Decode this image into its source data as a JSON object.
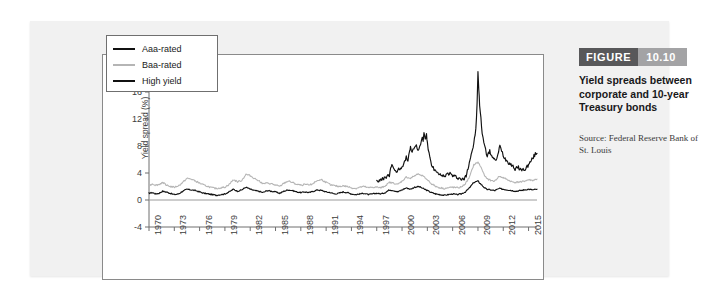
{
  "figure": {
    "label": "FIGURE",
    "number": "10.10",
    "caption": "Yield spreads between corporate and 10-year Treasury bonds",
    "source": "Source: Federal Reserve Bank of St. Louis",
    "label_bg": "#58585a",
    "number_bg": "#a3a3a5"
  },
  "chart_data": {
    "type": "line",
    "title": "Yield spreads between corporate and 10-year Treasury bonds",
    "xlabel": "",
    "ylabel": "Yield spread (%)",
    "xlim": [
      1970,
      2016
    ],
    "ylim": [
      -4,
      20
    ],
    "grid": false,
    "legend_position": "top-left",
    "ytick_labels": [
      "20",
      "16",
      "12",
      "8",
      "4",
      "0",
      "-4"
    ],
    "ytick_values": [
      20,
      16,
      12,
      8,
      4,
      0,
      -4
    ],
    "xtick_labels": [
      "1970",
      "1973",
      "1976",
      "1979",
      "1982",
      "1985",
      "1988",
      "1991",
      "1994",
      "1997",
      "2000",
      "2003",
      "2006",
      "2009",
      "2012",
      "2015"
    ],
    "xtick_values": [
      1970,
      1973,
      1976,
      1979,
      1982,
      1985,
      1988,
      1991,
      1994,
      1997,
      2000,
      2003,
      2006,
      2009,
      2012,
      2015
    ],
    "series": [
      {
        "name": "Aaa-rated",
        "color": "#111111",
        "x": [
          1970.0,
          1970.4,
          1970.8,
          1971.2,
          1971.6,
          1972.0,
          1972.5,
          1973.0,
          1973.5,
          1974.0,
          1974.5,
          1975.0,
          1975.5,
          1976.0,
          1976.5,
          1977.0,
          1977.5,
          1978.0,
          1978.5,
          1979.0,
          1979.5,
          1980.0,
          1980.5,
          1981.0,
          1981.5,
          1982.0,
          1982.5,
          1983.0,
          1983.5,
          1984.0,
          1984.5,
          1985.0,
          1985.5,
          1986.0,
          1986.5,
          1987.0,
          1987.5,
          1988.0,
          1988.5,
          1989.0,
          1989.5,
          1990.0,
          1990.5,
          1991.0,
          1991.5,
          1992.0,
          1992.5,
          1993.0,
          1993.5,
          1994.0,
          1994.5,
          1995.0,
          1995.5,
          1996.0,
          1996.5,
          1997.0,
          1997.5,
          1998.0,
          1998.5,
          1999.0,
          1999.5,
          2000.0,
          2000.5,
          2001.0,
          2001.5,
          2002.0,
          2002.5,
          2003.0,
          2003.5,
          2004.0,
          2004.5,
          2005.0,
          2005.5,
          2006.0,
          2006.5,
          2007.0,
          2007.5,
          2008.0,
          2008.5,
          2009.0,
          2009.3,
          2009.7,
          2010.0,
          2010.5,
          2011.0,
          2011.5,
          2012.0,
          2012.5,
          2013.0,
          2013.5,
          2014.0,
          2014.5,
          2015.0,
          2015.5,
          2016.0
        ],
        "y": [
          1.0,
          1.1,
          0.9,
          1.0,
          1.3,
          1.2,
          1.0,
          0.8,
          0.9,
          1.3,
          1.6,
          1.5,
          1.4,
          1.2,
          1.0,
          0.9,
          0.8,
          0.7,
          0.8,
          0.9,
          1.2,
          1.6,
          1.3,
          1.5,
          1.9,
          1.6,
          1.4,
          1.3,
          1.1,
          1.4,
          1.3,
          1.2,
          1.0,
          1.3,
          1.5,
          1.4,
          1.2,
          1.1,
          1.2,
          1.1,
          1.3,
          1.5,
          1.4,
          1.2,
          1.1,
          0.9,
          1.0,
          1.2,
          1.1,
          0.9,
          0.8,
          0.9,
          1.0,
          0.8,
          0.9,
          1.0,
          0.9,
          1.1,
          1.5,
          1.4,
          1.2,
          1.5,
          1.8,
          1.6,
          1.9,
          2.0,
          1.7,
          1.4,
          1.1,
          0.9,
          0.8,
          0.7,
          0.8,
          0.9,
          0.8,
          0.9,
          1.2,
          1.8,
          2.6,
          2.8,
          2.4,
          1.9,
          1.6,
          1.5,
          1.4,
          1.7,
          1.6,
          1.5,
          1.4,
          1.3,
          1.4,
          1.5,
          1.6,
          1.5,
          1.6
        ]
      },
      {
        "name": "Baa-rated",
        "color": "#b5b5b5",
        "x": [
          1970.0,
          1970.4,
          1970.8,
          1971.2,
          1971.6,
          1972.0,
          1972.5,
          1973.0,
          1973.5,
          1974.0,
          1974.5,
          1975.0,
          1975.5,
          1976.0,
          1976.5,
          1977.0,
          1977.5,
          1978.0,
          1978.5,
          1979.0,
          1979.5,
          1980.0,
          1980.5,
          1981.0,
          1981.5,
          1982.0,
          1982.5,
          1983.0,
          1983.5,
          1984.0,
          1984.5,
          1985.0,
          1985.5,
          1986.0,
          1986.5,
          1987.0,
          1987.5,
          1988.0,
          1988.5,
          1989.0,
          1989.5,
          1990.0,
          1990.5,
          1991.0,
          1991.5,
          1992.0,
          1992.5,
          1993.0,
          1993.5,
          1994.0,
          1994.5,
          1995.0,
          1995.5,
          1996.0,
          1996.5,
          1997.0,
          1997.5,
          1998.0,
          1998.5,
          1999.0,
          1999.5,
          2000.0,
          2000.5,
          2001.0,
          2001.5,
          2002.0,
          2002.5,
          2003.0,
          2003.5,
          2004.0,
          2004.5,
          2005.0,
          2005.5,
          2006.0,
          2006.5,
          2007.0,
          2007.5,
          2008.0,
          2008.5,
          2009.0,
          2009.3,
          2009.7,
          2010.0,
          2010.5,
          2011.0,
          2011.5,
          2012.0,
          2012.5,
          2013.0,
          2013.5,
          2014.0,
          2014.5,
          2015.0,
          2015.5,
          2016.0
        ],
        "y": [
          2.1,
          2.4,
          2.2,
          2.3,
          2.6,
          2.3,
          2.0,
          1.9,
          2.1,
          2.6,
          3.2,
          3.1,
          2.8,
          2.5,
          2.2,
          2.0,
          1.8,
          1.7,
          1.8,
          1.9,
          2.3,
          3.0,
          2.7,
          2.9,
          3.8,
          3.6,
          3.2,
          2.9,
          2.4,
          2.5,
          2.4,
          2.2,
          2.0,
          2.5,
          2.8,
          2.6,
          2.3,
          2.2,
          2.3,
          2.2,
          2.5,
          2.9,
          3.0,
          2.6,
          2.3,
          2.1,
          2.0,
          2.1,
          2.0,
          1.8,
          1.7,
          1.9,
          2.0,
          1.8,
          1.9,
          1.9,
          1.8,
          2.1,
          2.6,
          2.5,
          2.3,
          2.8,
          3.4,
          3.2,
          3.6,
          3.9,
          3.5,
          3.0,
          2.4,
          2.0,
          1.8,
          1.7,
          1.8,
          1.9,
          1.8,
          1.9,
          2.4,
          3.4,
          5.2,
          5.6,
          5.0,
          3.9,
          3.2,
          2.9,
          2.8,
          3.5,
          3.3,
          3.0,
          2.7,
          2.6,
          2.7,
          2.8,
          3.0,
          2.9,
          3.1
        ]
      },
      {
        "name": "High yield",
        "color": "#111111",
        "x": [
          1997.0,
          1997.3,
          1997.6,
          1997.9,
          1998.2,
          1998.5,
          1998.8,
          1999.0,
          1999.3,
          1999.6,
          1999.9,
          2000.1,
          2000.3,
          2000.5,
          2000.7,
          2000.9,
          2001.0,
          2001.2,
          2001.4,
          2001.6,
          2001.8,
          2002.0,
          2002.2,
          2002.4,
          2002.5,
          2002.6,
          2002.75,
          2002.9,
          2003.0,
          2003.2,
          2003.4,
          2003.6,
          2003.8,
          2004.0,
          2004.3,
          2004.6,
          2005.0,
          2005.3,
          2005.6,
          2006.0,
          2006.4,
          2006.8,
          2007.0,
          2007.3,
          2007.6,
          2007.9,
          2008.2,
          2008.5,
          2008.75,
          2008.9,
          2009.0,
          2009.1,
          2009.2,
          2009.35,
          2009.5,
          2009.7,
          2009.9,
          2010.1,
          2010.4,
          2010.7,
          2011.0,
          2011.3,
          2011.6,
          2011.8,
          2012.0,
          2012.3,
          2012.6,
          2013.0,
          2013.4,
          2013.8,
          2014.2,
          2014.6,
          2015.0,
          2015.4,
          2015.8,
          2016.0
        ],
        "y": [
          2.9,
          2.8,
          3.0,
          3.2,
          3.5,
          3.6,
          5.4,
          4.6,
          4.3,
          4.5,
          4.8,
          5.2,
          5.8,
          6.3,
          6.0,
          7.3,
          7.8,
          7.2,
          7.6,
          8.2,
          7.8,
          7.4,
          8.4,
          9.2,
          8.6,
          10.1,
          9.0,
          9.8,
          8.4,
          6.8,
          5.6,
          5.0,
          4.5,
          4.2,
          3.8,
          3.6,
          3.5,
          3.8,
          4.0,
          3.6,
          3.4,
          3.2,
          3.1,
          3.0,
          3.6,
          5.2,
          6.8,
          8.2,
          10.5,
          14.2,
          18.9,
          16.5,
          14.0,
          12.0,
          10.0,
          8.6,
          7.4,
          6.6,
          7.2,
          6.4,
          5.8,
          6.3,
          8.0,
          7.4,
          6.6,
          6.0,
          5.6,
          5.2,
          4.6,
          4.8,
          4.4,
          4.6,
          5.2,
          6.0,
          6.8,
          6.9
        ]
      }
    ]
  },
  "legend": {
    "items": [
      {
        "label": "Aaa-rated",
        "color": "#111111"
      },
      {
        "label": "Baa-rated",
        "color": "#b5b5b5"
      },
      {
        "label": "High yield",
        "color": "#111111"
      }
    ]
  }
}
